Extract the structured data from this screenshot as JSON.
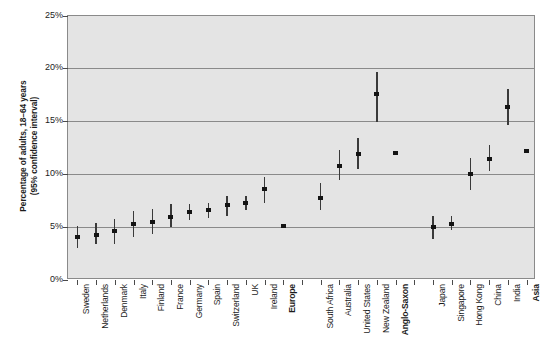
{
  "chart_data": {
    "type": "scatter",
    "title": "",
    "xlabel": "",
    "ylabel": "Percentage of adults, 18–64 years\n(95% confidence interval)",
    "ylim": [
      0,
      25
    ],
    "ytick_labels": [
      "0%",
      "5%",
      "10%",
      "15%",
      "20%",
      "25%"
    ],
    "ytick_values": [
      0,
      5,
      10,
      15,
      20,
      25
    ],
    "grid": true,
    "legend": "none",
    "error_bars": "95% confidence interval",
    "categories": [
      "Sweden",
      "Netherlands",
      "Denmark",
      "Italy",
      "Finland",
      "France",
      "Germany",
      "Spain",
      "Switzerland",
      "UK",
      "Ireland",
      "Europe",
      "",
      "South Africa",
      "Australia",
      "United States",
      "New Zealand",
      "Anglo-Saxon",
      "",
      "Japan",
      "Singapore",
      "Hong Kong",
      "China",
      "India",
      "Asia"
    ],
    "bold_categories": [
      "Europe",
      "Anglo-Saxon",
      "Asia"
    ],
    "points": [
      {
        "label": "Sweden",
        "value": 4.1,
        "low": 3.0,
        "high": 5.1,
        "bold": false
      },
      {
        "label": "Netherlands",
        "value": 4.3,
        "low": 3.4,
        "high": 5.4,
        "bold": false
      },
      {
        "label": "Denmark",
        "value": 4.6,
        "low": 3.4,
        "high": 5.8,
        "bold": false
      },
      {
        "label": "Italy",
        "value": 5.3,
        "low": 4.1,
        "high": 6.5,
        "bold": false
      },
      {
        "label": "Finland",
        "value": 5.5,
        "low": 4.4,
        "high": 6.7,
        "bold": false
      },
      {
        "label": "France",
        "value": 6.0,
        "low": 5.0,
        "high": 7.2,
        "bold": false
      },
      {
        "label": "Germany",
        "value": 6.4,
        "low": 5.7,
        "high": 7.2,
        "bold": false
      },
      {
        "label": "Spain",
        "value": 6.6,
        "low": 5.9,
        "high": 7.3,
        "bold": false
      },
      {
        "label": "Switzerland",
        "value": 7.1,
        "low": 6.1,
        "high": 8.0,
        "bold": false
      },
      {
        "label": "UK",
        "value": 7.3,
        "low": 6.6,
        "high": 8.0,
        "bold": false
      },
      {
        "label": "Ireland",
        "value": 8.6,
        "low": 7.3,
        "high": 9.8,
        "bold": false
      },
      {
        "label": "Europe",
        "value": 5.1,
        "low": 5.1,
        "high": 5.1,
        "bold": true
      },
      {
        "label": "South Africa",
        "value": 7.8,
        "low": 6.6,
        "high": 9.2,
        "bold": false
      },
      {
        "label": "Australia",
        "value": 10.8,
        "low": 9.5,
        "high": 12.3,
        "bold": false
      },
      {
        "label": "United States",
        "value": 11.9,
        "low": 10.5,
        "high": 13.4,
        "bold": false
      },
      {
        "label": "New Zealand",
        "value": 17.6,
        "low": 15.0,
        "high": 19.7,
        "bold": false
      },
      {
        "label": "Anglo-Saxon",
        "value": 12.0,
        "low": 12.0,
        "high": 12.0,
        "bold": true
      },
      {
        "label": "Japan",
        "value": 5.0,
        "low": 3.9,
        "high": 6.1,
        "bold": false
      },
      {
        "label": "Singapore",
        "value": 5.3,
        "low": 4.7,
        "high": 6.1,
        "bold": false
      },
      {
        "label": "Hong Kong",
        "value": 10.0,
        "low": 8.5,
        "high": 11.6,
        "bold": false
      },
      {
        "label": "China",
        "value": 11.5,
        "low": 10.3,
        "high": 12.8,
        "bold": false
      },
      {
        "label": "India",
        "value": 16.4,
        "low": 14.7,
        "high": 18.1,
        "bold": false
      },
      {
        "label": "Asia",
        "value": 12.2,
        "low": 12.2,
        "high": 12.2,
        "bold": true
      }
    ],
    "slot_map": [
      0,
      1,
      2,
      3,
      4,
      5,
      6,
      7,
      8,
      9,
      10,
      11,
      13,
      14,
      15,
      16,
      17,
      19,
      20,
      21,
      22,
      23,
      24
    ],
    "total_slots": 25,
    "colors": {
      "plot_background": "#e4e4e4",
      "gridline": "#8a8a8a",
      "marker": "#141414",
      "whisker": "#3a3a3a",
      "text": "#1c1c1c",
      "page_background": "#ffffff"
    }
  }
}
